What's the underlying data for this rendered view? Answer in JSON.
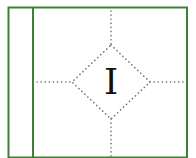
{
  "diagram": {
    "center_label": "I",
    "colors": {
      "border": "#3f7f3a",
      "dots": "#5a7a58",
      "label": "#111111",
      "background": "#ffffff"
    },
    "frame": {
      "left": 8.5,
      "top": 7.5,
      "right": 187,
      "bottom": 157,
      "divider_x": 33
    },
    "diamond": {
      "cx": 111,
      "cy": 82,
      "left": 72,
      "right": 150,
      "top": 45,
      "bottom": 119
    }
  }
}
